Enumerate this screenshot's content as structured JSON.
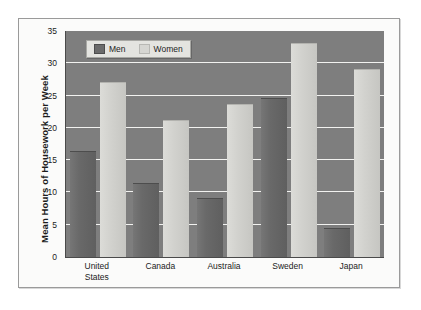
{
  "chart_data": {
    "type": "bar",
    "title": "",
    "xlabel": "",
    "ylabel": "Mean Hours of Housework per Week",
    "ylim": [
      0,
      35
    ],
    "ytick_values": [
      0,
      5,
      10,
      15,
      20,
      25,
      30,
      35
    ],
    "ytick_labels": [
      "0",
      "5",
      "10",
      "15",
      "20",
      "25",
      "30",
      "35"
    ],
    "grid": true,
    "legend_position": "top-left",
    "categories": [
      "United States",
      "Canada",
      "Australia",
      "Sweden",
      "Japan"
    ],
    "category_label_lines": [
      [
        "United",
        "States"
      ],
      [
        "Canada"
      ],
      [
        "Australia"
      ],
      [
        "Sweden"
      ],
      [
        "Japan"
      ]
    ],
    "series": [
      {
        "name": "Men",
        "values": [
          16.2,
          11.3,
          9.0,
          24.4,
          4.3
        ],
        "color": "#696969"
      },
      {
        "name": "Women",
        "values": [
          27.0,
          21.1,
          23.6,
          33.0,
          29.0
        ],
        "color": "#d2d2ce"
      }
    ]
  },
  "colors": {
    "plot_background": "#7e7e7e",
    "gridline": "#f2f2f0",
    "figure_background": "#fbfbfa",
    "frame_border": "#9a9a9a",
    "men_bar": "#696969",
    "women_bar": "#d2d2ce",
    "text": "#1c1c1c"
  }
}
